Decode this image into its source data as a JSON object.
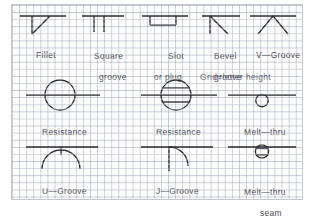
{
  "plate": {
    "title_note": "Grid=letter height",
    "grid_color": "#7882 96",
    "ink_color": "#2b2b33",
    "text_color": "#4a4a55",
    "paper_color": "#fdfdfd"
  },
  "rows": [
    {
      "row_index": 1,
      "cells": [
        {
          "id": "fillet",
          "symbol": "fillet-weld-symbol",
          "label_line1": "Fillet",
          "label_line2": ""
        },
        {
          "id": "square-groove",
          "symbol": "square-groove-weld-symbol",
          "label_line1": "Square",
          "label_line2": "groove"
        },
        {
          "id": "slot-or-plug",
          "symbol": "slot-or-plug-weld-symbol",
          "label_line1": "Slot",
          "label_line2": "or plug"
        },
        {
          "id": "bevel-groove",
          "symbol": "bevel-groove-weld-symbol",
          "label_line1": "Bevel",
          "label_line2": "groove"
        },
        {
          "id": "v-groove",
          "symbol": "v-groove-weld-symbol",
          "label_line1": "V—Groove",
          "label_line2": ""
        }
      ]
    },
    {
      "row_index": 2,
      "cells": [
        {
          "id": "resistance-spot",
          "symbol": "resistance-spot-weld-symbol",
          "label_line1": "Resistance",
          "label_line2": ""
        },
        {
          "id": "resistance-seam",
          "symbol": "resistance-seam-weld-symbol",
          "label_line1": "Resistance",
          "label_line2": ""
        },
        {
          "id": "melt-thru",
          "symbol": "melt-thru-weld-symbol",
          "label_line1": "Melt—thru",
          "label_line2": ""
        }
      ]
    },
    {
      "row_index": 3,
      "cells": [
        {
          "id": "u-groove",
          "symbol": "u-groove-weld-symbol",
          "label_line1": "U—Groove",
          "label_line2": ""
        },
        {
          "id": "j-groove",
          "symbol": "j-groove-weld-symbol",
          "label_line1": "J—Groove",
          "label_line2": ""
        },
        {
          "id": "melt-thru-seam",
          "symbol": "melt-thru-seam-weld-symbol",
          "label_line1": "Melt—thru",
          "label_line2": "seam"
        }
      ]
    }
  ],
  "labels": {
    "r1c1_l1": "Fillet",
    "r1c2_l1": "Square",
    "r1c2_l2": "groove",
    "r1c3_l1": "Slot",
    "r1c3_l2": "or plug",
    "r1c4_l1": "Bevel",
    "r1c4_l2": "groove",
    "r1c5_l1": "V—Groove",
    "note": "Grid=letter height",
    "r2c1_l1": "Resistance",
    "r2c2_l1": "Resistance",
    "r2c3_l1": "Melt—thru",
    "r3c1_l1": "U—Groove",
    "r3c2_l1": "J—Groove",
    "r3c3_l1": "Melt—thru",
    "r3c3_l2": "seam"
  }
}
